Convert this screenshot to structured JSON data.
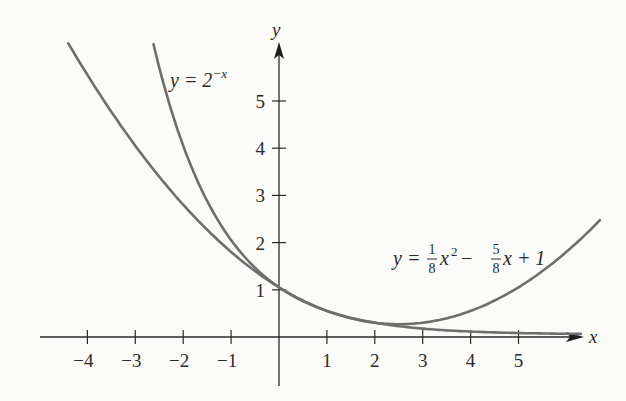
{
  "chart_data": {
    "type": "line",
    "title": "",
    "xlabel": "x",
    "ylabel": "y",
    "xlim": [
      -4.8,
      6.4
    ],
    "ylim": [
      -1.0,
      6.2
    ],
    "grid": false,
    "x_ticks": [
      "-4",
      "-3",
      "-2",
      "-1",
      "1",
      "2",
      "3",
      "4",
      "5"
    ],
    "y_ticks": [
      "1",
      "2",
      "3",
      "4",
      "5"
    ],
    "series": [
      {
        "name": "y = 2^(-x)",
        "label_parts": {
          "lhs": "y = 2",
          "exp": "−x"
        },
        "x_range": [
          -2.62,
          6.3
        ],
        "points": [
          [
            -2.62,
            6.15
          ],
          [
            -2,
            4
          ],
          [
            -1,
            2
          ],
          [
            0,
            1
          ],
          [
            1,
            0.5
          ],
          [
            2,
            0.25
          ],
          [
            3,
            0.125
          ],
          [
            4,
            0.0625
          ],
          [
            5,
            0.031
          ],
          [
            6.3,
            0.013
          ]
        ]
      },
      {
        "name": "y = (1/8)x^2 - (5/8)x + 1",
        "label_parts": {
          "lhs": "y = ",
          "frac1_num": "1",
          "frac1_den": "8",
          "t1": "x",
          "sq": "2",
          "minus": " − ",
          "frac2_num": "5",
          "frac2_den": "8",
          "t2": "x + 1"
        },
        "x_range": [
          -4.4,
          6.7
        ],
        "points": [
          [
            -4.4,
            6.17
          ],
          [
            -4,
            5.5
          ],
          [
            -3,
            4
          ],
          [
            -2,
            2.75
          ],
          [
            -1,
            1.75
          ],
          [
            0,
            1
          ],
          [
            1,
            0.5
          ],
          [
            2,
            0.25
          ],
          [
            2.5,
            0.22
          ],
          [
            3,
            0.25
          ],
          [
            4,
            0.5
          ],
          [
            5,
            1
          ],
          [
            6,
            1.75
          ],
          [
            6.7,
            2.42
          ]
        ]
      }
    ],
    "annotations": [
      "y = 2^(-x)",
      "y = (1/8)x^2 - (5/8)x + 1"
    ],
    "legend": "none (inline curve labels)"
  },
  "axes": {
    "x_label": "x",
    "y_label": "y",
    "x_tick_labels": [
      "−4",
      "−3",
      "−2",
      "−1",
      "1",
      "2",
      "3",
      "4",
      "5"
    ],
    "y_tick_labels": [
      "1",
      "2",
      "3",
      "4",
      "5"
    ]
  },
  "labels": {
    "exp_lhs": "y = 2",
    "exp_sup": "−x",
    "quad_lhs": "y = ",
    "quad_f1n": "1",
    "quad_f1d": "8",
    "quad_x": "x",
    "quad_sq": "2",
    "quad_minus": "−",
    "quad_f2n": "5",
    "quad_f2d": "8",
    "quad_tail": "x + 1"
  },
  "colors": {
    "curve": "#6e6e6e",
    "axis": "#2b2b2b",
    "background": "#fbfbfa"
  }
}
